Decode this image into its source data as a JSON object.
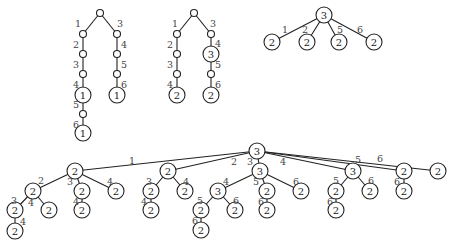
{
  "figure": {
    "colors": {
      "stroke": "#222222",
      "label": "#444444",
      "background": "#ffffff"
    },
    "radius": {
      "small": 3.5,
      "large": 8
    },
    "trees": [
      {
        "id": "tree-1",
        "nodes": [
          {
            "id": "a0",
            "x": 100,
            "y": 13,
            "label": ""
          },
          {
            "id": "a1",
            "x": 83,
            "y": 34,
            "label": ""
          },
          {
            "id": "a2",
            "x": 83,
            "y": 54,
            "label": ""
          },
          {
            "id": "a3",
            "x": 83,
            "y": 74,
            "label": ""
          },
          {
            "id": "a4",
            "x": 83,
            "y": 95,
            "label": "1"
          },
          {
            "id": "a5",
            "x": 83,
            "y": 114,
            "label": ""
          },
          {
            "id": "a6",
            "x": 83,
            "y": 133,
            "label": "1"
          },
          {
            "id": "a7",
            "x": 117,
            "y": 34,
            "label": ""
          },
          {
            "id": "a8",
            "x": 117,
            "y": 54,
            "label": ""
          },
          {
            "id": "a9",
            "x": 117,
            "y": 74,
            "label": ""
          },
          {
            "id": "a10",
            "x": 117,
            "y": 95,
            "label": "1"
          }
        ],
        "edges": [
          {
            "from": "a0",
            "to": "a1",
            "label": "1",
            "lx": 78,
            "ly": 23
          },
          {
            "from": "a1",
            "to": "a2",
            "label": "2",
            "lx": 76,
            "ly": 44
          },
          {
            "from": "a2",
            "to": "a3",
            "label": "3",
            "lx": 76,
            "ly": 64
          },
          {
            "from": "a3",
            "to": "a4",
            "label": "4",
            "lx": 76,
            "ly": 84
          },
          {
            "from": "a4",
            "to": "a5",
            "label": "5",
            "lx": 76,
            "ly": 104
          },
          {
            "from": "a5",
            "to": "a6",
            "label": "6",
            "lx": 76,
            "ly": 124
          },
          {
            "from": "a0",
            "to": "a7",
            "label": "3",
            "lx": 120,
            "ly": 23
          },
          {
            "from": "a7",
            "to": "a8",
            "label": "4",
            "lx": 124,
            "ly": 44
          },
          {
            "from": "a8",
            "to": "a9",
            "label": "5",
            "lx": 124,
            "ly": 64
          },
          {
            "from": "a9",
            "to": "a10",
            "label": "6",
            "lx": 124,
            "ly": 84
          }
        ]
      },
      {
        "id": "tree-2",
        "nodes": [
          {
            "id": "b0",
            "x": 194,
            "y": 13,
            "label": ""
          },
          {
            "id": "b1",
            "x": 177,
            "y": 34,
            "label": ""
          },
          {
            "id": "b2",
            "x": 177,
            "y": 54,
            "label": ""
          },
          {
            "id": "b3",
            "x": 177,
            "y": 74,
            "label": ""
          },
          {
            "id": "b4",
            "x": 177,
            "y": 95,
            "label": "2"
          },
          {
            "id": "b5",
            "x": 211,
            "y": 34,
            "label": ""
          },
          {
            "id": "b6",
            "x": 211,
            "y": 54,
            "label": "3"
          },
          {
            "id": "b7",
            "x": 211,
            "y": 74,
            "label": ""
          },
          {
            "id": "b8",
            "x": 211,
            "y": 95,
            "label": "2"
          }
        ],
        "edges": [
          {
            "from": "b0",
            "to": "b1",
            "label": "1",
            "lx": 175,
            "ly": 23
          },
          {
            "from": "b1",
            "to": "b2",
            "label": "2",
            "lx": 170,
            "ly": 44
          },
          {
            "from": "b2",
            "to": "b3",
            "label": "3",
            "lx": 170,
            "ly": 64
          },
          {
            "from": "b3",
            "to": "b4",
            "label": "4",
            "lx": 170,
            "ly": 84
          },
          {
            "from": "b0",
            "to": "b5",
            "label": "3",
            "lx": 213,
            "ly": 23
          },
          {
            "from": "b5",
            "to": "b6",
            "label": "4",
            "lx": 218,
            "ly": 43
          },
          {
            "from": "b6",
            "to": "b7",
            "label": "5",
            "lx": 218,
            "ly": 64
          },
          {
            "from": "b7",
            "to": "b8",
            "label": "6",
            "lx": 218,
            "ly": 84
          }
        ]
      },
      {
        "id": "tree-3",
        "nodes": [
          {
            "id": "c0",
            "x": 324,
            "y": 15,
            "label": "3"
          },
          {
            "id": "c1",
            "x": 272,
            "y": 42,
            "label": "2"
          },
          {
            "id": "c2",
            "x": 307,
            "y": 42,
            "label": "2"
          },
          {
            "id": "c3",
            "x": 339,
            "y": 42,
            "label": "2"
          },
          {
            "id": "c4",
            "x": 374,
            "y": 42,
            "label": "2"
          }
        ],
        "edges": [
          {
            "from": "c0",
            "to": "c1",
            "label": "1",
            "lx": 285,
            "ly": 29
          },
          {
            "from": "c0",
            "to": "c2",
            "label": "2",
            "lx": 305,
            "ly": 29
          },
          {
            "from": "c0",
            "to": "c3",
            "label": "5",
            "lx": 340,
            "ly": 29
          },
          {
            "from": "c0",
            "to": "c4",
            "label": "6",
            "lx": 360,
            "ly": 29
          }
        ]
      },
      {
        "id": "tree-4",
        "nodes": [
          {
            "id": "d0",
            "x": 257,
            "y": 151,
            "label": "3"
          },
          {
            "id": "d1",
            "x": 75,
            "y": 171,
            "label": "2"
          },
          {
            "id": "d2",
            "x": 33,
            "y": 191,
            "label": "2"
          },
          {
            "id": "d3",
            "x": 15,
            "y": 210,
            "label": "2"
          },
          {
            "id": "d4",
            "x": 15,
            "y": 231,
            "label": "2"
          },
          {
            "id": "d5",
            "x": 49,
            "y": 210,
            "label": "2"
          },
          {
            "id": "d6",
            "x": 82,
            "y": 191,
            "label": "2"
          },
          {
            "id": "d7",
            "x": 82,
            "y": 210,
            "label": "2"
          },
          {
            "id": "d8",
            "x": 116,
            "y": 191,
            "label": "2"
          },
          {
            "id": "d9",
            "x": 168,
            "y": 171,
            "label": "2"
          },
          {
            "id": "d10",
            "x": 151,
            "y": 191,
            "label": "2"
          },
          {
            "id": "d11",
            "x": 151,
            "y": 210,
            "label": "2"
          },
          {
            "id": "d12",
            "x": 185,
            "y": 191,
            "label": "2"
          },
          {
            "id": "d13",
            "x": 260,
            "y": 171,
            "label": "3"
          },
          {
            "id": "d14",
            "x": 218,
            "y": 191,
            "label": "3"
          },
          {
            "id": "d15",
            "x": 201,
            "y": 210,
            "label": "2"
          },
          {
            "id": "d16",
            "x": 201,
            "y": 230,
            "label": "2"
          },
          {
            "id": "d17",
            "x": 235,
            "y": 210,
            "label": "2"
          },
          {
            "id": "d18",
            "x": 267,
            "y": 191,
            "label": "2"
          },
          {
            "id": "d19",
            "x": 267,
            "y": 210,
            "label": "2"
          },
          {
            "id": "d20",
            "x": 301,
            "y": 191,
            "label": "2"
          },
          {
            "id": "d21",
            "x": 353,
            "y": 171,
            "label": "3"
          },
          {
            "id": "d22",
            "x": 336,
            "y": 191,
            "label": "2"
          },
          {
            "id": "d23",
            "x": 336,
            "y": 210,
            "label": "2"
          },
          {
            "id": "d24",
            "x": 370,
            "y": 191,
            "label": "2"
          },
          {
            "id": "d25",
            "x": 404,
            "y": 171,
            "label": "2"
          },
          {
            "id": "d26",
            "x": 404,
            "y": 191,
            "label": "2"
          },
          {
            "id": "d27",
            "x": 438,
            "y": 171,
            "label": "2"
          }
        ],
        "edges": [
          {
            "from": "d0",
            "to": "d1",
            "label": "1",
            "lx": 132,
            "ly": 160
          },
          {
            "from": "d1",
            "to": "d2",
            "label": "2",
            "lx": 41,
            "ly": 180
          },
          {
            "from": "d2",
            "to": "d3",
            "label": "3",
            "lx": 14,
            "ly": 200
          },
          {
            "from": "d3",
            "to": "d4",
            "label": "4",
            "lx": 23,
            "ly": 221
          },
          {
            "from": "d2",
            "to": "d5",
            "label": "4",
            "lx": 31,
            "ly": 202
          },
          {
            "from": "d1",
            "to": "d6",
            "label": "3",
            "lx": 70,
            "ly": 181
          },
          {
            "from": "d6",
            "to": "d7",
            "label": "4",
            "lx": 76,
            "ly": 201
          },
          {
            "from": "d1",
            "to": "d8",
            "label": "4",
            "lx": 110,
            "ly": 181
          },
          {
            "from": "d0",
            "to": "d9",
            "label": "2",
            "lx": 234,
            "ly": 161
          },
          {
            "from": "d9",
            "to": "d10",
            "label": "3",
            "lx": 149,
            "ly": 181
          },
          {
            "from": "d10",
            "to": "d11",
            "label": "4",
            "lx": 144,
            "ly": 201
          },
          {
            "from": "d9",
            "to": "d12",
            "label": "4",
            "lx": 186,
            "ly": 181
          },
          {
            "from": "d0",
            "to": "d13",
            "label": "3",
            "lx": 250,
            "ly": 161
          },
          {
            "from": "d13",
            "to": "d14",
            "label": "4",
            "lx": 226,
            "ly": 181
          },
          {
            "from": "d14",
            "to": "d15",
            "label": "5",
            "lx": 200,
            "ly": 200
          },
          {
            "from": "d15",
            "to": "d16",
            "label": "6",
            "lx": 195,
            "ly": 220
          },
          {
            "from": "d14",
            "to": "d17",
            "label": "6",
            "lx": 236,
            "ly": 200
          },
          {
            "from": "d13",
            "to": "d18",
            "label": "5",
            "lx": 256,
            "ly": 181
          },
          {
            "from": "d18",
            "to": "d19",
            "label": "6",
            "lx": 261,
            "ly": 201
          },
          {
            "from": "d13",
            "to": "d20",
            "label": "6",
            "lx": 296,
            "ly": 181
          },
          {
            "from": "d0",
            "to": "d21",
            "label": "4",
            "lx": 283,
            "ly": 161
          },
          {
            "from": "d21",
            "to": "d22",
            "label": "5",
            "lx": 336,
            "ly": 180
          },
          {
            "from": "d22",
            "to": "d23",
            "label": "6",
            "lx": 330,
            "ly": 201
          },
          {
            "from": "d21",
            "to": "d24",
            "label": "6",
            "lx": 371,
            "ly": 180
          },
          {
            "from": "d0",
            "to": "d25",
            "label": "5",
            "lx": 358,
            "ly": 159
          },
          {
            "from": "d25",
            "to": "d26",
            "label": "6",
            "lx": 397,
            "ly": 181
          },
          {
            "from": "d0",
            "to": "d27",
            "label": "6",
            "lx": 380,
            "ly": 158
          }
        ]
      }
    ]
  }
}
